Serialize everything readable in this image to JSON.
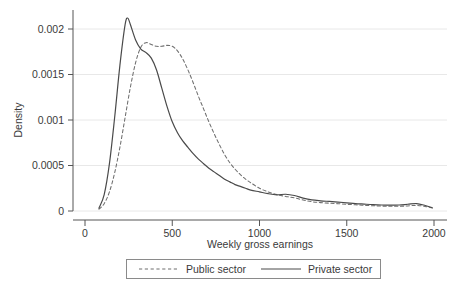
{
  "chart_data": {
    "type": "line",
    "title": "",
    "subtitle": "",
    "xlabel": "Weekly gross earnings",
    "ylabel": "Density",
    "xlim": [
      0,
      2000
    ],
    "ylim": [
      0,
      0.00225
    ],
    "xticks": [
      0,
      500,
      1000,
      1500,
      2000
    ],
    "xtick_labels": [
      "0",
      "500",
      "1000",
      "1500",
      "2000"
    ],
    "yticks": [
      0,
      0.0005,
      0.001,
      0.0015,
      0.002
    ],
    "ytick_labels": [
      "0",
      "0.0005",
      "0.001",
      "0.0015",
      "0.002"
    ],
    "grid": "horizontal",
    "legend_position": "below",
    "series": [
      {
        "name": "Public sector",
        "style": "dashed",
        "color": "#6f6f6f",
        "x": [
          80,
          110,
          140,
          170,
          200,
          230,
          260,
          290,
          320,
          350,
          380,
          410,
          440,
          470,
          500,
          530,
          560,
          590,
          620,
          650,
          680,
          710,
          740,
          770,
          800,
          830,
          860,
          890,
          920,
          950,
          1000,
          1050,
          1100,
          1150,
          1200,
          1250,
          1300,
          1350,
          1400,
          1450,
          1500,
          1550,
          1600,
          1650,
          1700,
          1750,
          1800,
          1850,
          1900,
          1950,
          1990
        ],
        "y": [
          2e-05,
          8e-05,
          0.00021,
          0.00042,
          0.0007,
          0.00103,
          0.00136,
          0.00163,
          0.0018,
          0.00185,
          0.00183,
          0.00181,
          0.00181,
          0.00182,
          0.00181,
          0.00176,
          0.00167,
          0.00155,
          0.00141,
          0.00126,
          0.00112,
          0.00098,
          0.00085,
          0.00073,
          0.00062,
          0.00053,
          0.00046,
          0.0004,
          0.00035,
          0.00031,
          0.00025,
          0.00021,
          0.00018,
          0.00016,
          0.000145,
          0.00012,
          0.000102,
          9.2e-05,
          8.6e-05,
          8e-05,
          7.4e-05,
          6.8e-05,
          6.2e-05,
          5.8e-05,
          5.4e-05,
          5.2e-05,
          5.2e-05,
          5.6e-05,
          6.2e-05,
          5e-05,
          3.2e-05
        ]
      },
      {
        "name": "Private sector",
        "style": "solid",
        "color": "#4a4a4a",
        "x": [
          80,
          110,
          140,
          170,
          200,
          230,
          245,
          260,
          290,
          320,
          350,
          380,
          410,
          440,
          470,
          500,
          530,
          560,
          590,
          620,
          650,
          680,
          710,
          740,
          770,
          800,
          830,
          860,
          890,
          920,
          950,
          1000,
          1050,
          1100,
          1150,
          1200,
          1250,
          1300,
          1350,
          1400,
          1450,
          1500,
          1550,
          1600,
          1650,
          1700,
          1750,
          1800,
          1850,
          1900,
          1950,
          1990
        ],
        "y": [
          3e-05,
          0.00018,
          0.00052,
          0.00103,
          0.0016,
          0.00205,
          0.00212,
          0.00205,
          0.00188,
          0.00178,
          0.00174,
          0.00168,
          0.00155,
          0.00135,
          0.00115,
          0.00098,
          0.00086,
          0.00077,
          0.0007,
          0.00063,
          0.00057,
          0.00052,
          0.00047,
          0.00043,
          0.00039,
          0.00035,
          0.00032,
          0.00029,
          0.00027,
          0.00025,
          0.00023,
          0.00021,
          0.00019,
          0.000178,
          0.000184,
          0.00017,
          0.000142,
          0.000122,
          0.000112,
          0.000105,
          9.8e-05,
          9e-05,
          8.2e-05,
          7.6e-05,
          7e-05,
          6.6e-05,
          6.4e-05,
          6.6e-05,
          7.4e-05,
          8.2e-05,
          6e-05,
          3.6e-05
        ]
      }
    ]
  },
  "legend": {
    "entries": [
      {
        "label": "Public sector"
      },
      {
        "label": "Private sector"
      }
    ]
  },
  "axes": {
    "y_title": "Density",
    "x_title": "Weekly gross earnings"
  },
  "colors": {
    "background": "#ffffff",
    "axis": "#555555",
    "grid": "#e8e8e8",
    "public_series": "#6f6f6f",
    "private_series": "#4a4a4a",
    "legend_border": "#8a8a8a",
    "text": "#3a3a3a"
  }
}
